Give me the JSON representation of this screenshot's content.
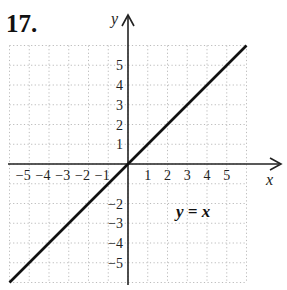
{
  "problem": {
    "number": "17."
  },
  "chart_data": {
    "type": "line",
    "title": "",
    "equation_label": "y = x",
    "xlabel": "x",
    "ylabel": "y",
    "xlim": [
      -6,
      6
    ],
    "ylim": [
      -6,
      6
    ],
    "grid": true,
    "grid_style": "dotted",
    "x_tick_labels": [
      "-5",
      "-4",
      "-3",
      "-2",
      "-1",
      "1",
      "2",
      "3",
      "4",
      "5"
    ],
    "y_tick_labels": [
      "5",
      "4",
      "3",
      "2",
      "1",
      "-2",
      "-3",
      "-4",
      "-5"
    ],
    "series": [
      {
        "name": "y = x",
        "x": [
          -6,
          6
        ],
        "y": [
          -6,
          6
        ]
      }
    ],
    "colors": {
      "line": "#111111",
      "axis": "#222222",
      "grid": "#bbbbbb"
    }
  }
}
